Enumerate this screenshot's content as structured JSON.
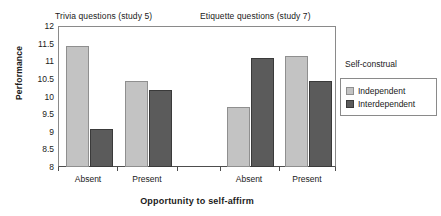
{
  "chart_data": {
    "type": "bar",
    "title": "",
    "panel_titles": [
      "Trivia questions (study 5)",
      "Etiquette questions (study 7)"
    ],
    "categories": [
      "Absent",
      "Present",
      "Absent",
      "Present"
    ],
    "series": [
      {
        "name": "Independent",
        "color": "#c3c3c3",
        "values": [
          11.45,
          10.48,
          9.72,
          11.17
        ]
      },
      {
        "name": "Interdependent",
        "color": "#5b5b5b",
        "values": [
          9.1,
          10.2,
          11.12,
          10.47
        ]
      }
    ],
    "xlabel": "Opportunity to self-affirm",
    "ylabel": "Performance",
    "ylim": [
      8,
      12
    ],
    "ytick_values": [
      8,
      8.5,
      9,
      9.5,
      10,
      10.5,
      11,
      11.5,
      12
    ],
    "ytick_labels": [
      "8",
      "8.5",
      "9",
      "9.5",
      "10",
      "10.5",
      "11",
      "11.5",
      "12"
    ],
    "grid": false,
    "legend_title": "Self-construal",
    "legend_position": "right",
    "legend_entries": [
      "Independent",
      "Interdependent"
    ]
  }
}
